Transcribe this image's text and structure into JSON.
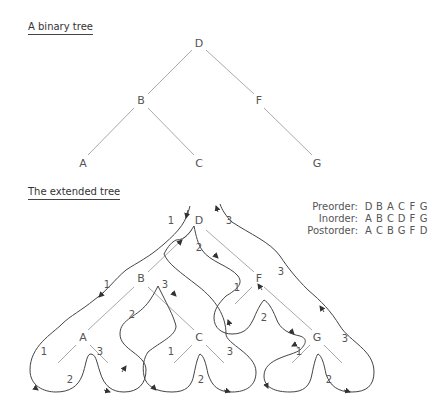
{
  "binary_tree": {
    "title": "A binary tree",
    "nodes": {
      "root": "D",
      "left": "B",
      "right": "F",
      "left_left": "A",
      "left_right": "C",
      "right_right": "G"
    }
  },
  "extended_tree": {
    "title": "The extended tree",
    "nodes": {
      "root": "D",
      "left": "B",
      "right": "F",
      "left_left": "A",
      "left_right": "C",
      "right_right": "G"
    },
    "visit_labels": {
      "one": "1",
      "two": "2",
      "three": "3"
    }
  },
  "traversals": [
    {
      "label": "Preorder:",
      "sequence": [
        "D",
        "B",
        "A",
        "C",
        "F",
        "G"
      ]
    },
    {
      "label": "Inorder:",
      "sequence": [
        "A",
        "B",
        "C",
        "D",
        "F",
        "G"
      ]
    },
    {
      "label": "Postorder:",
      "sequence": [
        "A",
        "C",
        "B",
        "G",
        "F",
        "D"
      ]
    }
  ],
  "colors": {
    "edge": "#aaaaaa",
    "path": "#444444",
    "text": "#555555"
  }
}
